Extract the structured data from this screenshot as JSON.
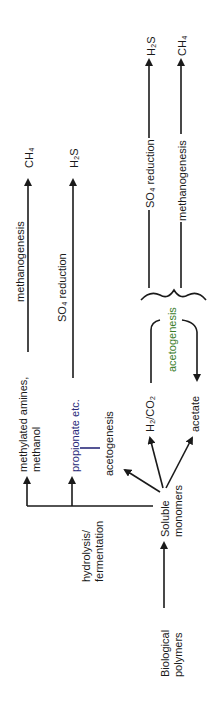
{
  "diagram": {
    "nodes": {
      "biological_polymers": [
        "Biological",
        "polymers"
      ],
      "soluble_monomers": [
        "Soluble",
        "monomers"
      ],
      "methylated_amines": [
        "methylated amines,",
        "methanol"
      ],
      "propionate": "propionate etc.",
      "h2co2": "H₂/CO₂",
      "acetate": "acetate",
      "ch4_left": "CH₄",
      "h2s_left": "H₂S",
      "h2s_right": "H₂S",
      "ch4_right": "CH₄"
    },
    "processes": {
      "hydrolysis": [
        "hydrolysis/",
        "fermentation"
      ],
      "methanogenesis_left": "methanogenesis",
      "so4_reduction_left": "SO₄ reduction",
      "acetogenesis_left": "acetogenesis",
      "acetogenesis_right": "acetogenesis",
      "so4_reduction_right": "SO₄ reduction",
      "methanogenesis_right": "methanogenesis"
    },
    "colors": {
      "line": "#1a1a1a",
      "acetogenesis_green": "#3a7d2a",
      "propionate_blue": "#2a2a7a",
      "methanol_red": "#c0303a"
    }
  }
}
